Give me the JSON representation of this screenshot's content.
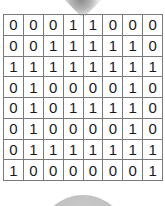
{
  "grid": {
    "rows": 8,
    "cols": 8,
    "cells": [
      [
        "0",
        "0",
        "0",
        "1",
        "1",
        "0",
        "0",
        "0"
      ],
      [
        "0",
        "0",
        "1",
        "1",
        "1",
        "1",
        "1",
        "0"
      ],
      [
        "1",
        "1",
        "1",
        "1",
        "1",
        "1",
        "1",
        "1"
      ],
      [
        "0",
        "1",
        "0",
        "0",
        "0",
        "0",
        "1",
        "0"
      ],
      [
        "0",
        "1",
        "0",
        "1",
        "1",
        "1",
        "1",
        "0"
      ],
      [
        "0",
        "1",
        "0",
        "0",
        "0",
        "0",
        "1",
        "0"
      ],
      [
        "0",
        "1",
        "1",
        "1",
        "1",
        "1",
        "1",
        "1"
      ],
      [
        "1",
        "0",
        "0",
        "0",
        "0",
        "0",
        "0",
        "1"
      ]
    ]
  },
  "colors": {
    "grid_line": "#7a7a7a",
    "text": "#1a1a1a",
    "shape_gray": "#bdbdbd"
  }
}
